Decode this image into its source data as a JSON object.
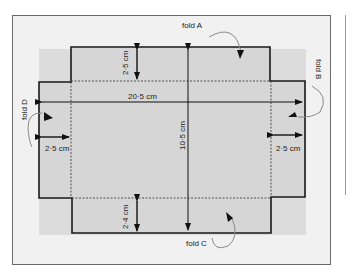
{
  "diagram": {
    "type": "box net (fold-up tray template)",
    "colors": {
      "frame_bg": "#f1f1f1",
      "band_bg": "#dcdcdc",
      "net_fill": "#d6d6d6",
      "outline": "#1a1a1a",
      "fold_line": "#444444",
      "curve_arrow": "#8a8a8a"
    },
    "folds": [
      {
        "id": "A",
        "label": "fold A",
        "side": "top"
      },
      {
        "id": "B",
        "label": "fold B",
        "side": "right"
      },
      {
        "id": "C",
        "label": "fold C",
        "side": "bottom"
      },
      {
        "id": "D",
        "label": "fold D",
        "side": "left"
      }
    ],
    "dimensions": {
      "total_width": "20·5 cm",
      "total_height": "10·5 cm",
      "top_flap_height": "2·5 cm",
      "bottom_flap_height": "2·4 cm",
      "left_flap_width": "2·5 cm",
      "right_flap_width": "2·5 cm"
    }
  }
}
